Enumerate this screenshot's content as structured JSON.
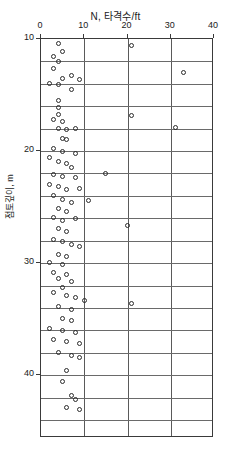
{
  "chart_data": {
    "type": "scatter",
    "title": "N, 타격수/ft",
    "xlabel": "N, 타격수/ft",
    "ylabel": "점토깊이, m",
    "xlim": [
      0,
      40
    ],
    "ylim": [
      10,
      45.6
    ],
    "y_inverted": true,
    "xticks": [
      0,
      10,
      20,
      30,
      40
    ],
    "yticks": [
      10,
      20,
      30,
      40
    ],
    "xtick_labels": [
      "0",
      "10",
      "20",
      "30",
      "40"
    ],
    "ytick_labels": [
      "10",
      "20",
      "30",
      "40"
    ],
    "grid": "both",
    "grid_x_step": 10,
    "grid_y_step": 2,
    "legend": "none",
    "marker": "open-circle",
    "marker_color": "#2b2b2b",
    "series": [
      {
        "name": "SPT N-value",
        "points": [
          [
            4,
            10.4
          ],
          [
            5,
            11.1
          ],
          [
            3,
            11.6
          ],
          [
            4,
            12.0
          ],
          [
            3,
            12.6
          ],
          [
            21,
            10.6
          ],
          [
            5,
            13.5
          ],
          [
            7,
            13.3
          ],
          [
            9,
            13.6
          ],
          [
            2,
            14.0
          ],
          [
            4,
            14.1
          ],
          [
            7,
            14.5
          ],
          [
            33,
            13.0
          ],
          [
            4,
            15.5
          ],
          [
            4,
            16.1
          ],
          [
            4,
            16.7
          ],
          [
            3,
            17.2
          ],
          [
            5,
            17.4
          ],
          [
            21,
            16.8
          ],
          [
            4,
            18.0
          ],
          [
            6,
            18.1
          ],
          [
            8,
            18.0
          ],
          [
            31,
            17.9
          ],
          [
            5,
            18.9
          ],
          [
            6,
            19.0
          ],
          [
            3,
            19.8
          ],
          [
            5,
            20.0
          ],
          [
            8,
            20.2
          ],
          [
            2,
            20.6
          ],
          [
            4,
            20.9
          ],
          [
            6,
            21.1
          ],
          [
            7,
            21.5
          ],
          [
            3,
            22.1
          ],
          [
            5,
            22.3
          ],
          [
            8,
            22.4
          ],
          [
            15,
            22.0
          ],
          [
            2,
            23.0
          ],
          [
            4,
            23.2
          ],
          [
            6,
            23.4
          ],
          [
            9,
            23.3
          ],
          [
            3,
            24.0
          ],
          [
            5,
            24.3
          ],
          [
            7,
            24.6
          ],
          [
            11,
            24.4
          ],
          [
            4,
            25.1
          ],
          [
            6,
            25.4
          ],
          [
            3,
            25.9
          ],
          [
            5,
            26.2
          ],
          [
            8,
            26.0
          ],
          [
            4,
            26.9
          ],
          [
            6,
            27.2
          ],
          [
            20,
            26.6
          ],
          [
            3,
            27.9
          ],
          [
            5,
            28.1
          ],
          [
            7,
            28.3
          ],
          [
            9,
            28.5
          ],
          [
            4,
            29.2
          ],
          [
            6,
            29.4
          ],
          [
            2,
            29.9
          ],
          [
            5,
            30.1
          ],
          [
            3,
            30.8
          ],
          [
            6,
            31.0
          ],
          [
            4,
            31.4
          ],
          [
            7,
            31.6
          ],
          [
            5,
            32.2
          ],
          [
            3,
            32.6
          ],
          [
            6,
            32.9
          ],
          [
            8,
            33.1
          ],
          [
            10,
            33.3
          ],
          [
            4,
            33.9
          ],
          [
            7,
            34.1
          ],
          [
            21,
            33.6
          ],
          [
            5,
            34.9
          ],
          [
            7,
            35.1
          ],
          [
            2,
            35.8
          ],
          [
            5,
            36.0
          ],
          [
            8,
            36.2
          ],
          [
            3,
            36.8
          ],
          [
            6,
            37.0
          ],
          [
            9,
            37.2
          ],
          [
            4,
            38.0
          ],
          [
            7,
            38.2
          ],
          [
            9,
            38.4
          ],
          [
            6,
            39.6
          ],
          [
            5,
            40.6
          ],
          [
            7,
            41.8
          ],
          [
            8,
            42.2
          ],
          [
            6,
            42.9
          ],
          [
            9,
            43.1
          ]
        ]
      }
    ]
  }
}
